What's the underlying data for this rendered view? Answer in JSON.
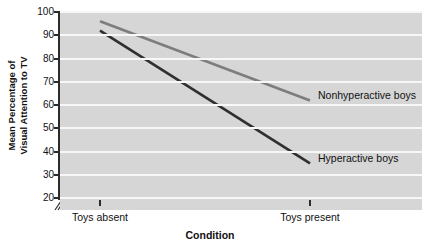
{
  "chart_data": {
    "type": "line",
    "title": "",
    "xlabel": "Condition",
    "ylabel": "Mean Percentage of Visual Attention to TV",
    "ylabel_line1": "Mean Percentage of",
    "ylabel_line2": "Visual Attention to TV",
    "categories": [
      "Toys absent",
      "Toys present"
    ],
    "ylim": [
      15,
      100
    ],
    "yticks": [
      100,
      90,
      80,
      70,
      60,
      50,
      40,
      30,
      20
    ],
    "ytick_labels": [
      "100",
      "90",
      "80",
      "70",
      "60",
      "50",
      "40",
      "30",
      "20"
    ],
    "grid": true,
    "grid_orientation": "horizontal",
    "axis_break": true,
    "legend_position": "inline-right-annotations",
    "series": [
      {
        "name": "Nonhyperactive boys",
        "values": [
          96,
          62
        ],
        "color": "#7d7d7d",
        "annotation": "Nonhyperactive boys"
      },
      {
        "name": "Hyperactive boys",
        "values": [
          92,
          35
        ],
        "color": "#2f2f2f",
        "annotation": "Hyperactive boys"
      }
    ],
    "plot_background": "#d6d6d6",
    "gridline_color": "#f7f7f7",
    "axis_color": "#2b2b2b"
  },
  "axes": {
    "y_title_line1": "Mean Percentage of",
    "y_title_line2": "Visual Attention to TV",
    "x_title": "Condition"
  },
  "annotations": {
    "nonhyperactive": "Nonhyperactive boys",
    "hyperactive": "Hyperactive boys"
  }
}
